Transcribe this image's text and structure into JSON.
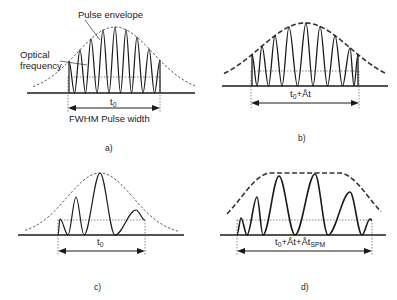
{
  "colors": {
    "ink": "#1a1a1a",
    "dashed": "#333333",
    "dotted": "#555555",
    "background": "#ffffff"
  },
  "panels": {
    "a": {
      "caption": "a)",
      "callouts": {
        "envelope": "Pulse envelope",
        "optical_line1": "Optical",
        "optical_line2": "frequency"
      },
      "width_symbol": "t",
      "width_subscript": "0",
      "width_caption": "FWHM Pulse width"
    },
    "b": {
      "caption": "b)",
      "width_symbol": "t",
      "width_subscript": "0",
      "width_suffix": "+Åt"
    },
    "c": {
      "caption": "c)",
      "width_symbol": "t",
      "width_subscript": "0"
    },
    "d": {
      "caption": "d)",
      "width_symbol": "t",
      "width_subscript": "0",
      "width_mid": "+Åt+Åt",
      "width_sub2": "SPM"
    }
  },
  "geometry": {
    "a": {
      "baseline": {
        "y": 93,
        "x1": 27,
        "x2": 195
      },
      "envelope": {
        "cx": 115,
        "peak_y": 27,
        "sigma": 38,
        "x1": 33,
        "x2": 195,
        "style": "dashed-fine"
      },
      "fwhm": {
        "y": 77,
        "x1": 68,
        "x2": 160
      },
      "arrow_y": 108,
      "oscillation_peaks": [
        69,
        80,
        91,
        103,
        115,
        126,
        137,
        149,
        160
      ],
      "stroke": 1.2
    },
    "b": {
      "baseline": {
        "y": 86,
        "x1": 222,
        "x2": 388
      },
      "envelope": {
        "cx": 305,
        "peak_y": 23,
        "sigma": 45,
        "x1": 224,
        "x2": 386,
        "style": "dashed-bold"
      },
      "fwhm": {
        "y": 71,
        "x1": 251,
        "x2": 359
      },
      "arrow_y": 103,
      "oscillation_peaks": [
        252,
        262,
        275,
        289,
        306,
        320,
        335,
        350,
        358
      ],
      "stroke": 1.3
    },
    "c": {
      "baseline": {
        "y": 235,
        "x1": 18,
        "x2": 184
      },
      "envelope": {
        "cx": 100,
        "peak_y": 173,
        "sigma": 33,
        "x1": 25,
        "x2": 178,
        "style": "dashed-fine"
      },
      "fwhm": {
        "y": 220,
        "x1": 58,
        "x2": 145
      },
      "arrow_y": 251,
      "wave_points": [
        [
          58,
          235
        ],
        [
          60,
          219
        ],
        [
          68,
          235
        ],
        [
          76,
          197
        ],
        [
          84,
          235
        ],
        [
          100,
          173
        ],
        [
          115,
          235
        ],
        [
          136,
          210
        ],
        [
          145,
          220
        ]
      ],
      "stroke": 1.2
    },
    "d": {
      "baseline": {
        "y": 235,
        "x1": 220,
        "x2": 386
      },
      "envelope": {
        "cx": 305,
        "peak_y": 173,
        "flat": 34,
        "sigma": 30,
        "x1": 227,
        "x2": 381,
        "style": "dashed-bold"
      },
      "fwhm": {
        "y": 220,
        "x1": 237,
        "x2": 372
      },
      "arrow_y": 251,
      "wave_points": [
        [
          237,
          235
        ],
        [
          241,
          218
        ],
        [
          247,
          235
        ],
        [
          257,
          197
        ],
        [
          263,
          235
        ],
        [
          279,
          176
        ],
        [
          295,
          235
        ],
        [
          315,
          174
        ],
        [
          328,
          235
        ],
        [
          350,
          192
        ],
        [
          362,
          235
        ],
        [
          370,
          219
        ],
        [
          372,
          220
        ]
      ],
      "stroke": 1.6
    }
  }
}
